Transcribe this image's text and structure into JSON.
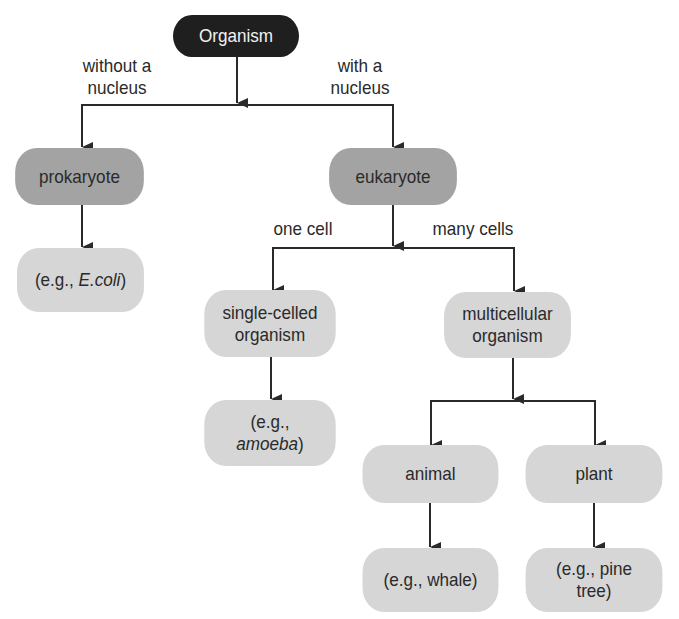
{
  "diagram": {
    "colors": {
      "root_fill": "#1f1f1f",
      "level1_fill": "#a3a3a3",
      "leaf_fill": "#d6d6d6",
      "line": "#2a2a2a"
    },
    "nodes": {
      "organism": {
        "label": "Organism"
      },
      "prokaryote": {
        "label": "prokaryote"
      },
      "eukaryote": {
        "label": "eukaryote"
      },
      "ecoli": {
        "prefix": "(e.g., ",
        "italic": "E.coli",
        "suffix": ")"
      },
      "single_celled": {
        "line1": "single-celled",
        "line2": "organism"
      },
      "multicellular": {
        "line1": "multicellular",
        "line2": "organism"
      },
      "amoeba": {
        "line1": "(e.g.,",
        "italic": "amoeba",
        "suffix": ")"
      },
      "animal": {
        "label": "animal"
      },
      "plant": {
        "label": "plant"
      },
      "whale": {
        "label": "(e.g., whale)"
      },
      "pine_tree": {
        "line1": "(e.g., pine",
        "line2": "tree)"
      }
    },
    "edge_labels": {
      "without_nucleus": {
        "line1": "without a",
        "line2": "nucleus"
      },
      "with_nucleus": {
        "line1": "with a",
        "line2": "nucleus"
      },
      "one_cell": "one cell",
      "many_cells": "many cells"
    },
    "edges": [
      {
        "from": "organism",
        "to": "prokaryote",
        "label": "without a nucleus"
      },
      {
        "from": "organism",
        "to": "eukaryote",
        "label": "with a nucleus"
      },
      {
        "from": "prokaryote",
        "to": "ecoli"
      },
      {
        "from": "eukaryote",
        "to": "single_celled",
        "label": "one cell"
      },
      {
        "from": "eukaryote",
        "to": "multicellular",
        "label": "many cells"
      },
      {
        "from": "single_celled",
        "to": "amoeba"
      },
      {
        "from": "multicellular",
        "to": "animal"
      },
      {
        "from": "multicellular",
        "to": "plant"
      },
      {
        "from": "animal",
        "to": "whale"
      },
      {
        "from": "plant",
        "to": "pine_tree"
      }
    ]
  }
}
